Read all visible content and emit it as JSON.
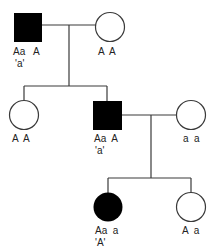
{
  "diagram": {
    "type": "pedigree",
    "colors": {
      "affected": "#000000",
      "unaffected": "#ffffff",
      "line": "#3a3a3a"
    },
    "individuals": [
      {
        "id": "I-1",
        "sex": "male",
        "affected": true,
        "genotype": "Aa   A",
        "phenotype": "'a'"
      },
      {
        "id": "I-2",
        "sex": "female",
        "affected": false,
        "genotype": "A  A",
        "phenotype": ""
      },
      {
        "id": "II-1",
        "sex": "female",
        "affected": false,
        "genotype": "A  A",
        "phenotype": ""
      },
      {
        "id": "II-2",
        "sex": "male",
        "affected": true,
        "genotype": "Aa  A",
        "phenotype": "'a'"
      },
      {
        "id": "II-3",
        "sex": "female",
        "affected": false,
        "genotype": "a  a",
        "phenotype": ""
      },
      {
        "id": "III-1",
        "sex": "female",
        "affected": true,
        "genotype": "Aa  a",
        "phenotype": "'A'"
      },
      {
        "id": "III-2",
        "sex": "female",
        "affected": false,
        "genotype": "A  a",
        "phenotype": ""
      }
    ]
  }
}
